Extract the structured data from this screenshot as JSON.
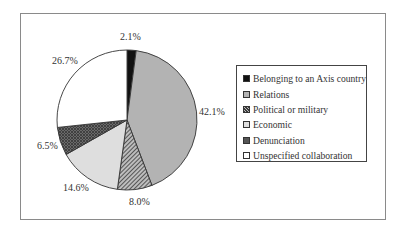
{
  "chart_data": {
    "type": "pie",
    "title": "",
    "start_angle": "12 o'clock",
    "direction": "clockwise",
    "categories": [
      "Belonging to an Axis country",
      "Relations",
      "Political or military",
      "Economic",
      "Denunciation",
      "Unspecified collaboration"
    ],
    "values": [
      2.1,
      42.1,
      8.0,
      14.6,
      6.5,
      26.7
    ],
    "labels": [
      "2.1%",
      "42.1%",
      "8.0%",
      "14.6%",
      "6.5%",
      "26.7%"
    ],
    "fills": [
      {
        "type": "solid",
        "color": "#111111"
      },
      {
        "type": "solid",
        "color": "#b3b3b3"
      },
      {
        "type": "diagonal-hatch",
        "color": "#3a3a3a",
        "bg": "#bdbdbd"
      },
      {
        "type": "solid",
        "color": "#dedede"
      },
      {
        "type": "crosshatch",
        "color": "#3c3c3c",
        "bg": "#6a6a6a"
      },
      {
        "type": "solid",
        "color": "#ffffff"
      }
    ],
    "legend_position": "right",
    "grid": false
  },
  "labels": {
    "l0": "2.1%",
    "l1": "42.1%",
    "l2": "8.0%",
    "l3": "14.6%",
    "l4": "6.5%",
    "l5": "26.7%"
  },
  "legend": {
    "items": [
      {
        "label": "Belonging to an Axis country"
      },
      {
        "label": "Relations"
      },
      {
        "label": "Political or military"
      },
      {
        "label": "Economic"
      },
      {
        "label": "Denunciation"
      },
      {
        "label": "Unspecified collaboration"
      }
    ]
  }
}
